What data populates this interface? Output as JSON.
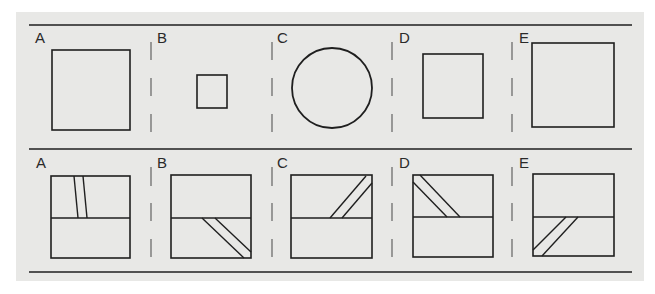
{
  "figure": {
    "colors": {
      "background": "#e8e8e6",
      "stroke": "#1f1f1f",
      "divider": "#555555"
    },
    "top_row": {
      "labels": [
        "A",
        "B",
        "C",
        "D",
        "E"
      ],
      "shapes": [
        {
          "label": "A",
          "type": "square",
          "x": 52,
          "y": 50,
          "w": 78,
          "h": 80
        },
        {
          "label": "B",
          "type": "square",
          "x": 197,
          "y": 75,
          "w": 30,
          "h": 33
        },
        {
          "label": "C",
          "type": "circle",
          "cx": 332,
          "cy": 88,
          "r": 40
        },
        {
          "label": "D",
          "type": "square",
          "x": 423,
          "y": 54,
          "w": 60,
          "h": 64
        },
        {
          "label": "E",
          "type": "square",
          "x": 532,
          "y": 43,
          "w": 82,
          "h": 84
        }
      ]
    },
    "bottom_row": {
      "labels": [
        "A",
        "B",
        "C",
        "D",
        "E"
      ],
      "shapes": [
        {
          "label": "A",
          "box": [
            51,
            176,
            79,
            82
          ],
          "mid_y": 218,
          "strip": [
            [
              74,
              176,
              78,
              218
            ],
            [
              83,
              176,
              87,
              218
            ]
          ]
        },
        {
          "label": "B",
          "box": [
            171,
            175,
            80,
            83
          ],
          "mid_y": 218,
          "strip": [
            [
              202,
              218,
              244,
              258
            ],
            [
              215,
              218,
              251,
              252
            ]
          ]
        },
        {
          "label": "C",
          "box": [
            291,
            175,
            81,
            83
          ],
          "mid_y": 218,
          "strip": [
            [
              330,
              218,
              366,
              176
            ],
            [
              342,
              218,
              372,
              183
            ]
          ]
        },
        {
          "label": "D",
          "box": [
            413,
            175,
            80,
            82
          ],
          "mid_y": 217,
          "strip": [
            [
              413,
              182,
              447,
              217
            ],
            [
              420,
              175,
              460,
              217
            ]
          ]
        },
        {
          "label": "E",
          "box": [
            533,
            174,
            81,
            82
          ],
          "mid_y": 217,
          "strip": [
            [
              533,
              250,
              566,
              217
            ],
            [
              542,
              256,
              578,
              217
            ]
          ]
        }
      ]
    },
    "divider_x": [
      151,
      272,
      392,
      512
    ]
  }
}
